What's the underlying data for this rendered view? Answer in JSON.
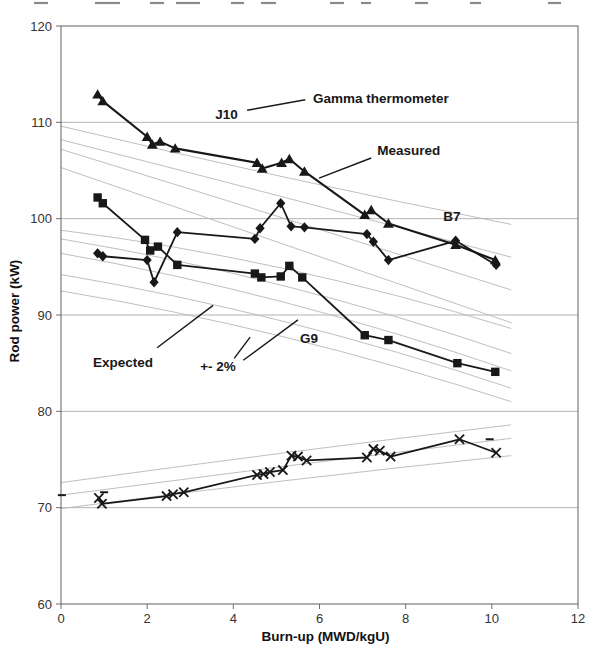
{
  "chart_data": {
    "type": "line",
    "title": "",
    "xlabel": "Burn-up (MWD/kgU)",
    "ylabel": "Rod power (kW)",
    "xlim": [
      0,
      12
    ],
    "ylim": [
      60,
      120
    ],
    "xticks": [
      0,
      2,
      4,
      6,
      8,
      10,
      12
    ],
    "yticks": [
      60,
      70,
      80,
      90,
      100,
      110,
      120
    ],
    "grid": "horizontal",
    "legend": "none",
    "series": [
      {
        "name": "J10",
        "marker": "triangle",
        "color": "#181818",
        "points": [
          [
            0.85,
            112.9
          ],
          [
            0.97,
            112.2
          ],
          [
            2.0,
            108.5
          ],
          [
            2.12,
            107.7
          ],
          [
            2.3,
            108.0
          ],
          [
            2.65,
            107.3
          ],
          [
            4.55,
            105.8
          ],
          [
            4.67,
            105.2
          ],
          [
            5.12,
            105.8
          ],
          [
            5.3,
            106.2
          ],
          [
            5.65,
            104.9
          ],
          [
            7.05,
            100.4
          ],
          [
            7.2,
            100.9
          ],
          [
            7.6,
            99.5
          ],
          [
            9.16,
            97.3
          ],
          [
            10.08,
            95.7
          ]
        ]
      },
      {
        "name": "B7",
        "marker": "diamond",
        "color": "#181818",
        "points": [
          [
            0.85,
            96.4
          ],
          [
            0.97,
            96.1
          ],
          [
            2.0,
            95.7
          ],
          [
            2.16,
            93.4
          ],
          [
            2.7,
            98.6
          ],
          [
            4.5,
            97.9
          ],
          [
            4.62,
            99.0
          ],
          [
            5.1,
            101.6
          ],
          [
            5.34,
            99.2
          ],
          [
            5.65,
            99.1
          ],
          [
            7.1,
            98.4
          ],
          [
            7.25,
            97.6
          ],
          [
            7.6,
            95.7
          ],
          [
            9.16,
            97.7
          ],
          [
            10.1,
            95.2
          ]
        ]
      },
      {
        "name": "G9",
        "marker": "square",
        "color": "#181818",
        "points": [
          [
            0.85,
            102.2
          ],
          [
            0.97,
            101.6
          ],
          [
            1.95,
            97.8
          ],
          [
            2.07,
            96.7
          ],
          [
            2.25,
            97.1
          ],
          [
            2.7,
            95.2
          ],
          [
            4.5,
            94.3
          ],
          [
            4.65,
            93.9
          ],
          [
            5.1,
            94.0
          ],
          [
            5.3,
            95.1
          ],
          [
            5.6,
            93.9
          ],
          [
            7.05,
            87.9
          ],
          [
            7.6,
            87.4
          ],
          [
            9.2,
            85.0
          ],
          [
            10.08,
            84.1
          ]
        ]
      },
      {
        "name": "D10",
        "marker": "x",
        "color": "#181818",
        "points": [
          [
            0.88,
            71.0
          ],
          [
            0.95,
            70.4
          ],
          [
            2.45,
            71.2
          ],
          [
            2.6,
            71.4
          ],
          [
            2.85,
            71.6
          ],
          [
            4.55,
            73.4
          ],
          [
            4.7,
            73.5
          ],
          [
            4.85,
            73.7
          ],
          [
            5.15,
            73.9
          ],
          [
            5.35,
            75.4
          ],
          [
            5.5,
            75.3
          ],
          [
            5.7,
            74.9
          ],
          [
            7.1,
            75.2
          ],
          [
            7.25,
            76.1
          ],
          [
            7.4,
            75.9
          ],
          [
            7.65,
            75.3
          ],
          [
            9.25,
            77.1
          ],
          [
            10.1,
            75.7
          ]
        ]
      }
    ],
    "expected_lines": [
      [
        [
          0,
          109.6
        ],
        [
          5.2,
          104.3
        ],
        [
          10.45,
          99.4
        ]
      ],
      [
        [
          0,
          108.2
        ],
        [
          5.2,
          102.2
        ],
        [
          10.45,
          96.0
        ]
      ],
      [
        [
          0,
          107.2
        ],
        [
          5.2,
          100.0
        ],
        [
          10.45,
          92.6
        ]
      ],
      [
        [
          0,
          105.3
        ],
        [
          5.2,
          97.3
        ],
        [
          10.45,
          89.2
        ]
      ],
      [
        [
          0,
          98.8
        ],
        [
          5.2,
          94.8
        ],
        [
          10.45,
          88.6
        ]
      ],
      [
        [
          0,
          97.9
        ],
        [
          5.2,
          93.0
        ],
        [
          10.45,
          86.0
        ]
      ],
      [
        [
          0,
          96.4
        ],
        [
          5.2,
          91.3
        ],
        [
          10.45,
          84.2
        ]
      ],
      [
        [
          0,
          94.2
        ],
        [
          5.2,
          89.3
        ],
        [
          10.45,
          82.4
        ]
      ],
      [
        [
          0,
          92.5
        ],
        [
          5.2,
          87.7
        ],
        [
          10.45,
          81.0
        ]
      ],
      [
        [
          0,
          72.6
        ],
        [
          5.2,
          75.7
        ],
        [
          10.45,
          78.6
        ]
      ],
      [
        [
          0,
          71.3
        ],
        [
          5.2,
          74.3
        ],
        [
          10.45,
          77.2
        ]
      ],
      [
        [
          0,
          69.9
        ],
        [
          5.2,
          72.8
        ],
        [
          10.45,
          75.4
        ]
      ]
    ],
    "dash_marks": [
      [
        0.02,
        71.3
      ],
      [
        1.0,
        71.6
      ],
      [
        9.95,
        77.1
      ]
    ],
    "annotations": [
      {
        "id": "j10",
        "text": "J10",
        "x": 3.58,
        "y": 110.35,
        "leaders": []
      },
      {
        "id": "gamma",
        "text": "Gamma thermometer",
        "x": 5.85,
        "y": 112.0,
        "leaders": [
          [
            [
              5.67,
              112.35
            ],
            [
              4.32,
              111.25
            ]
          ]
        ]
      },
      {
        "id": "measured",
        "text": "Measured",
        "x": 7.34,
        "y": 106.6,
        "leaders": [
          [
            [
              7.2,
              106.3
            ],
            [
              5.99,
              104.2
            ]
          ]
        ]
      },
      {
        "id": "b7",
        "text": "B7",
        "x": 8.87,
        "y": 99.75,
        "leaders": []
      },
      {
        "id": "g9",
        "text": "G9",
        "x": 5.55,
        "y": 87.1,
        "leaders": []
      },
      {
        "id": "expected",
        "text": "Expected",
        "x": 0.74,
        "y": 84.6,
        "leaders": [
          [
            [
              2.23,
              86.6
            ],
            [
              3.53,
              91.0
            ]
          ]
        ]
      },
      {
        "id": "pm2",
        "text": "+- 2%",
        "x": 3.23,
        "y": 84.2,
        "leaders": [
          [
            [
              4.02,
              85.5
            ],
            [
              4.39,
              87.7
            ]
          ],
          [
            [
              4.23,
              85.3
            ],
            [
              5.5,
              89.5
            ]
          ]
        ]
      }
    ],
    "top_edge_fragments": [
      [
        34,
        48
      ],
      [
        95,
        120
      ],
      [
        150,
        164
      ],
      [
        176,
        200
      ],
      [
        231,
        244
      ],
      [
        261,
        276
      ],
      [
        330,
        344
      ],
      [
        361,
        371
      ],
      [
        415,
        428
      ],
      [
        470,
        481
      ],
      [
        548,
        561
      ]
    ]
  },
  "colors": {
    "series": "#181818",
    "expected_line": "#b8b8b8",
    "gridline": "#a0a0a0",
    "frame": "#6e6e6e",
    "tick_label": "#333333",
    "axis_title": "#111111",
    "fragment": "#8a8a8a"
  }
}
